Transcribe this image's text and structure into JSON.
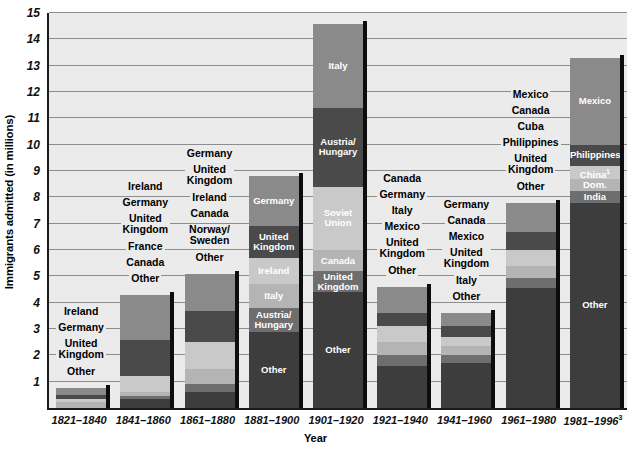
{
  "chart_data": {
    "type": "bar",
    "subtype": "stacked-bar",
    "title": "",
    "xlabel": "Year",
    "ylabel": "Immigrants admitted (in millions)",
    "ylim": [
      0,
      15
    ],
    "ytick_step": 1,
    "grid": true,
    "legend": "none (segments labeled in place)",
    "footnote_markers": [
      "1",
      "2",
      "3"
    ],
    "categories": [
      "1821–1840",
      "1841–1860",
      "1861–1880",
      "1881–1900",
      "1901–1920",
      "1921–1940",
      "1941–1960",
      "1961–1980",
      "1981–1996"
    ],
    "totals": [
      0.75,
      4.3,
      5.1,
      8.8,
      14.6,
      8.2,
      3.6,
      7.8,
      13.3
    ],
    "bars": [
      {
        "period": "1821–1840",
        "total": 0.75,
        "label_placement": "outside",
        "segments": [
          {
            "name": "Ireland",
            "value": 0.25
          },
          {
            "name": "Germany",
            "value": 0.17
          },
          {
            "name": "United Kingdom",
            "value": 0.12
          },
          {
            "name": "Other",
            "value": 0.21
          }
        ]
      },
      {
        "period": "1841–1860",
        "total": 4.3,
        "label_placement": "outside",
        "segments": [
          {
            "name": "Ireland",
            "value": 1.7
          },
          {
            "name": "Germany",
            "value": 1.4
          },
          {
            "name": "United Kingdom",
            "value": 0.6
          },
          {
            "name": "France",
            "value": 0.15
          },
          {
            "name": "Canada",
            "value": 0.1
          },
          {
            "name": "Other",
            "value": 0.35
          }
        ]
      },
      {
        "period": "1861–1880",
        "total": 5.1,
        "label_placement": "outside",
        "segments": [
          {
            "name": "Germany",
            "value": 1.4
          },
          {
            "name": "United Kingdom",
            "value": 1.2
          },
          {
            "name": "Ireland",
            "value": 1.0
          },
          {
            "name": "Canada",
            "value": 0.6
          },
          {
            "name": "Norway/Sweden",
            "value": 0.3
          },
          {
            "name": "Other",
            "value": 0.6
          }
        ]
      },
      {
        "period": "1881–1900",
        "total": 8.8,
        "label_placement": "inside",
        "segments": [
          {
            "name": "Germany",
            "value": 1.9
          },
          {
            "name": "United Kingdom",
            "value": 1.2
          },
          {
            "name": "Ireland",
            "value": 1.0
          },
          {
            "name": "Italy",
            "value": 0.9
          },
          {
            "name": "Austria/Hungary",
            "value": 0.9
          },
          {
            "name": "Other",
            "value": 2.9
          }
        ]
      },
      {
        "period": "1901–1920",
        "total": 14.6,
        "label_placement": "inside",
        "segments": [
          {
            "name": "Italy",
            "value": 3.2
          },
          {
            "name": "Austria/Hungary",
            "value": 3.0
          },
          {
            "name": "Soviet Union",
            "value": 2.4
          },
          {
            "name": "Canada",
            "value": 0.8
          },
          {
            "name": "United Kingdom",
            "value": 0.8
          },
          {
            "name": "Other",
            "value": 4.4
          }
        ]
      },
      {
        "period": "1921–1940",
        "total": 4.6,
        "label_placement": "outside",
        "segments": [
          {
            "name": "Canada",
            "value": 1.0
          },
          {
            "name": "Germany",
            "value": 0.5
          },
          {
            "name": "Italy",
            "value": 0.6
          },
          {
            "name": "Mexico",
            "value": 0.5
          },
          {
            "name": "United Kingdom",
            "value": 0.4
          },
          {
            "name": "Other",
            "value": 1.6
          }
        ]
      },
      {
        "period": "1941–1960",
        "total": 3.6,
        "label_placement": "outside",
        "segments": [
          {
            "name": "Germany",
            "value": 0.5
          },
          {
            "name": "Canada",
            "value": 0.4
          },
          {
            "name": "Mexico",
            "value": 0.35
          },
          {
            "name": "United Kingdom",
            "value": 0.35
          },
          {
            "name": "Italy",
            "value": 0.3
          },
          {
            "name": "Other",
            "value": 1.7
          }
        ]
      },
      {
        "period": "1961–1980",
        "total": 7.8,
        "label_placement": "outside",
        "segments": [
          {
            "name": "Mexico",
            "value": 1.1
          },
          {
            "name": "Canada",
            "value": 0.7
          },
          {
            "name": "Cuba",
            "value": 0.6
          },
          {
            "name": "Philippines",
            "value": 0.45
          },
          {
            "name": "United Kingdom",
            "value": 0.4
          },
          {
            "name": "Other",
            "value": 4.55
          }
        ]
      },
      {
        "period": "1981–1996",
        "total": 13.3,
        "label_placement": "inside",
        "segments": [
          {
            "name": "Mexico",
            "value": 3.3
          },
          {
            "name": "Philippines",
            "value": 0.8
          },
          {
            "name": "China¹",
            "value": 0.5
          },
          {
            "name": "Dom. Rep.²",
            "value": 0.45
          },
          {
            "name": "India",
            "value": 0.45
          },
          {
            "name": "Other",
            "value": 7.8
          }
        ]
      }
    ]
  },
  "axes": {
    "y_title": "Immigrants admitted (in millions)",
    "x_title": "Year",
    "y_ticks": [
      "15",
      "14",
      "13",
      "12",
      "11",
      "10",
      "9",
      "8",
      "7",
      "6",
      "5",
      "4",
      "3",
      "2",
      "1"
    ],
    "x_ticks": [
      {
        "text": "1821–1840",
        "sup": ""
      },
      {
        "text": "1841–1860",
        "sup": ""
      },
      {
        "text": "1861–1880",
        "sup": ""
      },
      {
        "text": "1881–1900",
        "sup": ""
      },
      {
        "text": "1901–1920",
        "sup": ""
      },
      {
        "text": "1921–1940",
        "sup": ""
      },
      {
        "text": "1941–1960",
        "sup": ""
      },
      {
        "text": "1961–1980",
        "sup": ""
      },
      {
        "text": "1981–1996",
        "sup": "3"
      }
    ]
  },
  "colors": {
    "plot_background": "#ebebeb",
    "page_background": "#ffffff",
    "gridline": "#8d8d8d",
    "axis": "#1a1a1a",
    "bar_shadow": "#0d0d0d",
    "palette": {
      "light": "#c9c9c9",
      "light_mid": "#b4b4b4",
      "mid": "#8a8a8a",
      "mid_dark": "#6e6e6e",
      "dark": "#4a4a4a",
      "darkest": "#3d3d3d"
    },
    "text_dark": "#111111",
    "text_light": "#ffffff"
  },
  "outside_labels": {
    "bar_1": [
      "Ireland",
      "Germany",
      "United\nKingdom",
      "Other"
    ],
    "bar_2": [
      "Ireland",
      "Germany",
      "United\nKingdom",
      "France",
      "Canada",
      "Other"
    ],
    "bar_3": [
      "Germany",
      "United\nKingdom",
      "Ireland",
      "Canada",
      "Norway/\nSweden",
      "Other"
    ],
    "bar_6": [
      "Canada",
      "Germany",
      "Italy",
      "Mexico",
      "United\nKingdom",
      "Other"
    ],
    "bar_7": [
      "Germany",
      "Canada",
      "Mexico",
      "United\nKingdom",
      "Italy",
      "Other"
    ],
    "bar_8": [
      "Mexico",
      "Canada",
      "Cuba",
      "Philippines",
      "United\nKingdom",
      "Other"
    ]
  }
}
